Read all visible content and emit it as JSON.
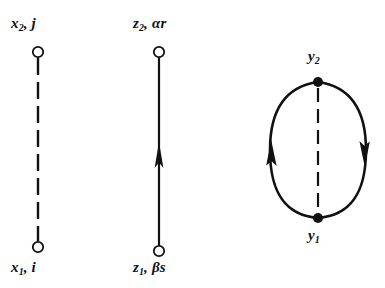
{
  "figure": {
    "background_color": "#ffffff",
    "stroke_color": "#111111",
    "width": 385,
    "height": 288
  },
  "diagrams": [
    {
      "id": "diagram-dashed-x",
      "name": "x-propagator-dashed",
      "edge_style": "dashed",
      "edge_direction": "none",
      "nodes": [
        {
          "id": "x2",
          "marker": "open-circle",
          "label_text": "x2, j",
          "label_base": "x",
          "label_sub": "2",
          "label_suffix": ", j",
          "position": "top"
        },
        {
          "id": "x1",
          "marker": "open-circle",
          "label_text": "x1, i",
          "label_base": "x",
          "label_sub": "1",
          "label_suffix": ", i",
          "position": "bottom"
        }
      ]
    },
    {
      "id": "diagram-arrow-z",
      "name": "z-propagator-arrow",
      "edge_style": "solid",
      "edge_direction": "upward",
      "nodes": [
        {
          "id": "z2",
          "marker": "open-circle",
          "label_text": "z2, αr",
          "label_base": "z",
          "label_sub": "2",
          "label_suffix": ", αr",
          "position": "top"
        },
        {
          "id": "z1",
          "marker": "open-circle",
          "label_text": "z1, βs",
          "label_base": "z",
          "label_sub": "1",
          "label_suffix": ", βs",
          "position": "bottom"
        }
      ]
    },
    {
      "id": "diagram-loop-y",
      "name": "y-loop-with-dashed-chord",
      "edge_style": "solid-arcs-with-dashed-chord",
      "edge_direction": "left-arc-upward-right-arc-downward",
      "nodes": [
        {
          "id": "y2",
          "marker": "filled-dot",
          "label_text": "y2",
          "label_base": "y",
          "label_sub": "2",
          "label_suffix": "",
          "position": "top"
        },
        {
          "id": "y1",
          "marker": "filled-dot",
          "label_text": "y1",
          "label_base": "y",
          "label_sub": "1",
          "label_suffix": "",
          "position": "bottom"
        }
      ]
    }
  ]
}
